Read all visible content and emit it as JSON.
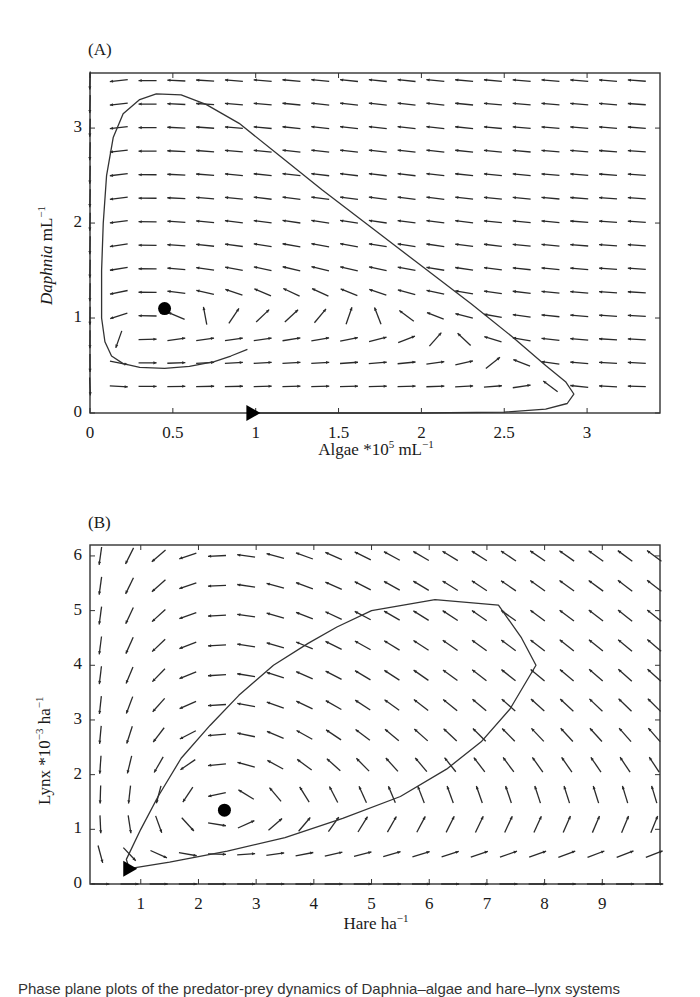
{
  "chart_data": [
    {
      "id": "A",
      "panel_label": "(A)",
      "type": "quiver",
      "title": "",
      "xlabel": "Algae *10^5 mL^-1",
      "xlabel_parts": {
        "main": "Algae *10",
        "sup1": "5",
        "unit": " mL",
        "sup2": "−1"
      },
      "ylabel": "Daphnia mL^-1",
      "ylabel_parts": {
        "italic": "Daphnia",
        "unit": " mL",
        "sup": "−1"
      },
      "xlim": [
        0,
        3.44
      ],
      "ylim": [
        0,
        3.58
      ],
      "xticks": [
        0,
        0.5,
        1,
        1.5,
        2,
        2.5,
        3
      ],
      "xtick_labels": [
        "0",
        "0.5",
        "1",
        "1.5",
        "2",
        "2.5",
        "3"
      ],
      "yticks": [
        0,
        1,
        2,
        3
      ],
      "ytick_labels": [
        "0",
        "1",
        "2",
        "3"
      ],
      "grid": false,
      "equilibrium_point": {
        "x": 0.45,
        "y": 1.1
      },
      "start_marker": {
        "x": 0.98,
        "y": 0.0,
        "shape": "triangle-right"
      },
      "trajectory": [
        [
          0.98,
          0.0
        ],
        [
          1.5,
          0.0
        ],
        [
          2.0,
          0.0
        ],
        [
          2.5,
          0.01
        ],
        [
          2.75,
          0.04
        ],
        [
          2.88,
          0.1
        ],
        [
          2.92,
          0.2
        ],
        [
          2.87,
          0.33
        ],
        [
          2.75,
          0.5
        ],
        [
          2.55,
          0.8
        ],
        [
          2.3,
          1.15
        ],
        [
          2.0,
          1.55
        ],
        [
          1.7,
          1.95
        ],
        [
          1.4,
          2.35
        ],
        [
          1.15,
          2.7
        ],
        [
          0.9,
          3.05
        ],
        [
          0.7,
          3.25
        ],
        [
          0.55,
          3.35
        ],
        [
          0.4,
          3.36
        ],
        [
          0.3,
          3.3
        ],
        [
          0.2,
          3.15
        ],
        [
          0.14,
          2.9
        ],
        [
          0.1,
          2.5
        ],
        [
          0.08,
          2.0
        ],
        [
          0.07,
          1.5
        ],
        [
          0.07,
          1.0
        ],
        [
          0.09,
          0.75
        ],
        [
          0.13,
          0.6
        ],
        [
          0.2,
          0.52
        ],
        [
          0.3,
          0.48
        ],
        [
          0.45,
          0.47
        ],
        [
          0.6,
          0.49
        ],
        [
          0.75,
          0.54
        ],
        [
          0.85,
          0.6
        ],
        [
          0.95,
          0.67
        ]
      ],
      "field": {
        "model": "rosenzweig-macarthur",
        "cols": 20,
        "rows": 14,
        "x0": 0.0,
        "x1": 3.3,
        "y0": 0.28,
        "y1": 3.5
      }
    },
    {
      "id": "B",
      "panel_label": "(B)",
      "type": "quiver",
      "title": "",
      "xlabel": "Hare ha^-1",
      "xlabel_parts": {
        "main": "Hare ha",
        "sup": "−1"
      },
      "ylabel": "Lynx *10^-3 ha^-1",
      "ylabel_parts": {
        "main": "Lynx *10",
        "sup1": "−3",
        "unit": " ha",
        "sup2": "−1"
      },
      "xlim": [
        0.12,
        10.0
      ],
      "ylim": [
        0,
        6.2
      ],
      "xticks": [
        1,
        2,
        3,
        4,
        5,
        6,
        7,
        8,
        9
      ],
      "xtick_labels": [
        "1",
        "2",
        "3",
        "4",
        "5",
        "6",
        "7",
        "8",
        "9"
      ],
      "yticks": [
        0,
        1,
        2,
        3,
        4,
        5,
        6
      ],
      "ytick_labels": [
        "0",
        "1",
        "2",
        "3",
        "4",
        "5",
        "6"
      ],
      "grid": false,
      "equilibrium_point": {
        "x": 2.45,
        "y": 1.35
      },
      "start_marker": {
        "x": 0.8,
        "y": 0.28,
        "shape": "triangle-right"
      },
      "trajectory": [
        [
          0.8,
          0.28
        ],
        [
          1.5,
          0.4
        ],
        [
          2.5,
          0.6
        ],
        [
          3.5,
          0.85
        ],
        [
          4.5,
          1.2
        ],
        [
          5.5,
          1.6
        ],
        [
          6.3,
          2.1
        ],
        [
          6.9,
          2.6
        ],
        [
          7.4,
          3.2
        ],
        [
          7.85,
          4.0
        ],
        [
          7.6,
          4.5
        ],
        [
          7.2,
          5.1
        ],
        [
          6.1,
          5.2
        ],
        [
          5.0,
          5.0
        ],
        [
          4.4,
          4.7
        ],
        [
          3.9,
          4.4
        ],
        [
          3.3,
          4.0
        ],
        [
          2.7,
          3.45
        ],
        [
          2.2,
          2.9
        ],
        [
          1.7,
          2.3
        ],
        [
          1.3,
          1.6
        ],
        [
          1.0,
          1.0
        ],
        [
          0.75,
          0.45
        ],
        [
          0.8,
          0.28
        ]
      ],
      "field": {
        "model": "lotka-volterra",
        "cols": 20,
        "rows": 12,
        "x0": 0.3,
        "x1": 9.9,
        "y0": 0.0,
        "y1": 6.0
      }
    }
  ],
  "caption_partial": "Phase plane plots of the predator-prey dynamics of Daphnia–algae and hare–lynx systems"
}
